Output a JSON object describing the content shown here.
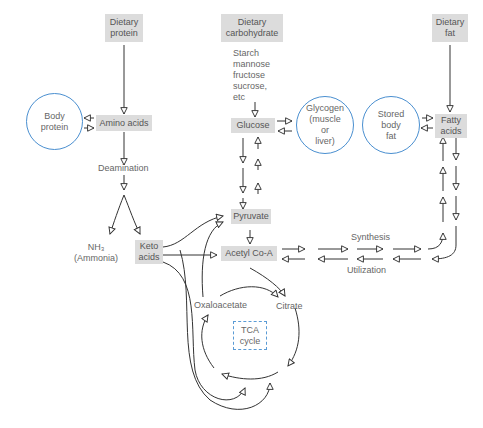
{
  "nodes": {
    "dietary_protein": "Dietary\nprotein",
    "dietary_carbohydrate": "Dietary\ncarbohydrate",
    "dietary_fat": "Dietary\nfat",
    "carb_sources": "Starch\nmannose\nfructose\nsucrose,\netc",
    "body_protein": "Body\nprotein",
    "amino_acids": "Amino acids",
    "glucose": "Glucose",
    "glycogen": "Glycogen\n(muscle\nor\nliver)",
    "stored_body_fat": "Stored\nbody\nfat",
    "fatty_acids": "Fatty\nacids",
    "deamination": "Deamination",
    "nh3": "NH₃\n(Ammonia)",
    "keto_acids": "Keto\nacids",
    "pyruvate": "Pyruvate",
    "acetyl_coa": "Acetyl Co-A",
    "synthesis": "Synthesis",
    "utilization": "Utilization",
    "oxaloacetate": "Oxaloacetate",
    "citrate": "Citrate",
    "tca_cycle": "TCA\ncycle"
  },
  "colors": {
    "box_fill": "#dcdcdc",
    "circle_stroke": "#4a8fd0",
    "tca_dash": "#5a9bd5",
    "arrow": "#333333"
  }
}
